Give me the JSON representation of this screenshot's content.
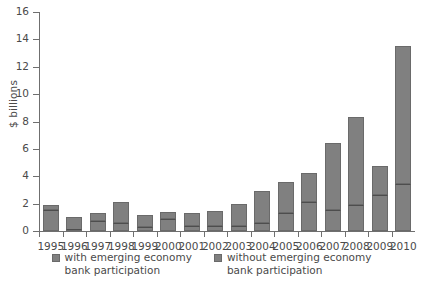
{
  "chart_data": {
    "type": "bar",
    "stacked": true,
    "title": "",
    "xlabel": "",
    "ylabel": "$ billions",
    "ylim": [
      0,
      16
    ],
    "yticks": [
      0,
      2,
      4,
      6,
      8,
      10,
      12,
      14,
      16
    ],
    "grid": false,
    "legend_position": "bottom",
    "categories": [
      "1995",
      "1996",
      "1997",
      "1998",
      "1999",
      "2000",
      "2001",
      "2002",
      "2003",
      "2004",
      "2005",
      "2006",
      "2007",
      "2008",
      "2009",
      "2010"
    ],
    "series": [
      {
        "name": "with emerging economy bank participation",
        "values": [
          1.55,
          0.1,
          0.7,
          0.6,
          0.3,
          0.9,
          0.35,
          0.4,
          0.4,
          0.6,
          1.3,
          2.1,
          1.5,
          1.9,
          2.6,
          3.4
        ]
      },
      {
        "name": "without emerging economy bank participation",
        "values": [
          0.35,
          0.95,
          0.6,
          1.55,
          0.85,
          0.5,
          0.95,
          1.05,
          1.55,
          2.3,
          2.25,
          2.15,
          4.95,
          6.4,
          2.15,
          10.1
        ]
      }
    ],
    "totals": [
      1.9,
      1.05,
      1.3,
      2.15,
      1.15,
      1.4,
      1.3,
      1.45,
      1.95,
      2.9,
      3.55,
      4.25,
      6.45,
      8.3,
      4.75,
      13.5
    ],
    "colors": {
      "bar_fill": "#808080",
      "bar_edge": "#6a6a6a",
      "divider": "#4d4d4d",
      "axis": "#6f6f6f",
      "text": "#4a4a4a",
      "background": "#ffffff"
    }
  },
  "legend": {
    "items": [
      {
        "label": "with emerging economy\nbank participation",
        "swatch": "legend-swatch-with"
      },
      {
        "label": "without emerging economy\nbank participation",
        "swatch": "legend-swatch-without"
      }
    ]
  }
}
